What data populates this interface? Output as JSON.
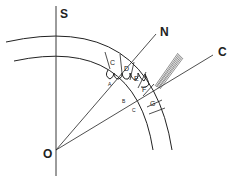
{
  "diagram": {
    "type": "commutator-brush-geometry",
    "axis_labels": {
      "S": "S",
      "N": "N",
      "C": "C",
      "O": "O"
    },
    "segments": [
      "C",
      "D",
      "E",
      "F",
      "G"
    ],
    "coil_labels": [
      "A",
      "B",
      "C"
    ],
    "brush": "brush",
    "colors": {
      "line": "#222222",
      "background": "#ffffff"
    }
  }
}
